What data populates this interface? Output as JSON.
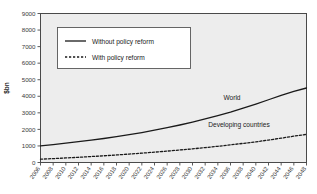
{
  "chart_data": {
    "type": "line",
    "title": "",
    "xlabel": "",
    "ylabel": "$bn",
    "ylim": [
      0,
      9000
    ],
    "ytick_labels": [
      "0",
      "1000",
      "2000",
      "3000",
      "4000",
      "5000",
      "6000",
      "7000",
      "8000",
      "9000"
    ],
    "ytick_values": [
      0,
      1000,
      2000,
      3000,
      4000,
      5000,
      6000,
      7000,
      8000,
      9000
    ],
    "grid": false,
    "legend_position": "upper-left-inside",
    "x": [
      2006,
      2008,
      2010,
      2012,
      2014,
      2016,
      2018,
      2020,
      2022,
      2024,
      2026,
      2028,
      2030,
      2032,
      2034,
      2036,
      2038,
      2040,
      2042,
      2044,
      2046,
      2048
    ],
    "xtick_labels": [
      "2006",
      "2008",
      "2010",
      "2012",
      "2014",
      "2016",
      "2018",
      "2020",
      "2022",
      "2024",
      "2026",
      "2028",
      "2030",
      "2032",
      "2034",
      "2036",
      "2038",
      "2040",
      "2042",
      "2044",
      "2046",
      "2048"
    ],
    "series": [
      {
        "name": "Without policy reform",
        "style": "solid",
        "annotation": "World",
        "color": "#1a1a1a",
        "values": [
          1000,
          1080,
          1165,
          1255,
          1350,
          1450,
          1560,
          1680,
          1810,
          1950,
          2100,
          2265,
          2440,
          2630,
          2835,
          3050,
          3285,
          3530,
          3790,
          4060,
          4290,
          4500
        ]
      },
      {
        "name": "With policy reform",
        "style": "dashed",
        "annotation": "Developing countries",
        "color": "#1a1a1a",
        "values": [
          200,
          235,
          275,
          315,
          360,
          405,
          455,
          510,
          565,
          625,
          690,
          755,
          825,
          900,
          980,
          1065,
          1155,
          1250,
          1355,
          1470,
          1590,
          1700
        ]
      }
    ]
  },
  "legend": {
    "items": [
      {
        "label": "Without policy reform",
        "style": "solid"
      },
      {
        "label": "With policy reform",
        "style": "dashed"
      }
    ]
  },
  "annotations": [
    {
      "label": "World"
    },
    {
      "label": "Developing countries"
    }
  ],
  "axis": {
    "y_title": "$bn"
  },
  "colors": {
    "plot_background": "#ededed",
    "page_background": "#ffffff",
    "frame": "#4a4a4a",
    "line": "#1a1a1a",
    "text": "#333333",
    "legend_background": "#ffffff"
  }
}
